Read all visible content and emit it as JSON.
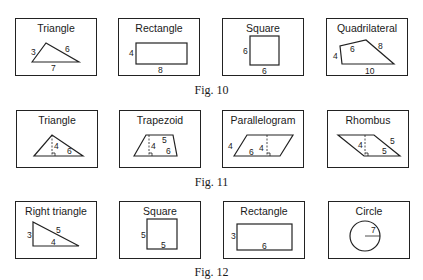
{
  "figures": [
    {
      "caption": "Fig. 10",
      "shapes": [
        {
          "title": "Triangle",
          "labels": {
            "left": "3",
            "right": "6",
            "base": "7"
          }
        },
        {
          "title": "Rectangle",
          "labels": {
            "height": "4",
            "width": "8"
          }
        },
        {
          "title": "Square",
          "labels": {
            "height": "6",
            "width": "6"
          }
        },
        {
          "title": "Quadrilateral",
          "labels": {
            "left": "4",
            "top": "6",
            "right": "8",
            "base": "10"
          }
        }
      ]
    },
    {
      "caption": "Fig. 11",
      "shapes": [
        {
          "title": "Triangle",
          "labels": {
            "height": "4",
            "base": "6"
          }
        },
        {
          "title": "Trapezoid",
          "labels": {
            "top": "5",
            "height": "4",
            "base": "6"
          }
        },
        {
          "title": "Parallelogram",
          "labels": {
            "side": "4",
            "height": "4",
            "base": "6"
          }
        },
        {
          "title": "Rhombus",
          "labels": {
            "height": "4",
            "side": "5",
            "base": "5"
          }
        }
      ]
    },
    {
      "caption": "Fig. 12",
      "shapes": [
        {
          "title": "Right triangle",
          "labels": {
            "leg_vertical": "3",
            "hypotenuse": "5",
            "leg_horizontal": "4"
          }
        },
        {
          "title": "Square",
          "labels": {
            "height": "5",
            "width": "5"
          }
        },
        {
          "title": "Rectangle",
          "labels": {
            "height": "3",
            "width": "6"
          }
        },
        {
          "title": "Circle",
          "labels": {
            "radius": "7"
          }
        }
      ]
    }
  ]
}
